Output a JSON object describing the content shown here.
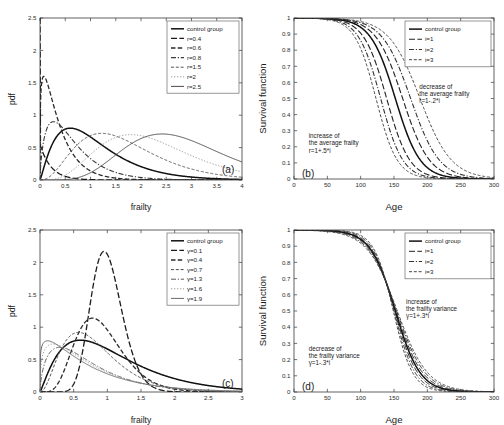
{
  "figure": {
    "title": "",
    "panels": [
      "a",
      "b",
      "c",
      "d"
    ]
  },
  "chart_data": [
    {
      "id": "a",
      "tag": "(a)",
      "type": "line",
      "title": "",
      "xlabel": "frailty",
      "ylabel": "pdf",
      "xlim": [
        0,
        4
      ],
      "ylim": [
        0,
        2.5
      ],
      "xticks": [
        "0",
        "0.5",
        "1",
        "1.5",
        "2",
        "2.5",
        "3",
        "3.5",
        "4"
      ],
      "xtickvals": [
        0,
        0.5,
        1,
        1.5,
        2,
        2.5,
        3,
        3.5,
        4
      ],
      "yticks": [
        "0",
        "0.5",
        "1",
        "1.5",
        "2",
        "2.5"
      ],
      "ytickvals": [
        0,
        0.5,
        1,
        1.5,
        2,
        2.5
      ],
      "grid": false,
      "legend_position": "top-right",
      "legend": [
        "control group",
        "r=0.4",
        "r=0.6",
        "r=0.8",
        "r=1.5",
        "r=2",
        "r=2.5"
      ],
      "series": [
        {
          "name": "control group",
          "shape": "gamma",
          "k": 2.2,
          "scale": 0.5,
          "peak": 0.8,
          "mode": 0.68,
          "style": "solid",
          "color": "#111111",
          "width": 1.5
        },
        {
          "name": "r=0.4",
          "shape": "gamma",
          "k": 1.0,
          "scale": 0.22,
          "peak": 2.5,
          "mode": 0.0,
          "style": "dash-long",
          "color": "#1c1c1c",
          "width": 1.3
        },
        {
          "name": "r=0.6",
          "shape": "gamma",
          "k": 1.25,
          "scale": 0.3,
          "peak": 1.6,
          "mode": 0.1,
          "style": "dash-med",
          "color": "#2a2a2a",
          "width": 1.3
        },
        {
          "name": "r=0.8",
          "shape": "gamma",
          "k": 1.7,
          "scale": 0.38,
          "peak": 0.9,
          "mode": 0.3,
          "style": "dash-dot",
          "color": "#3a3a3a",
          "width": 1.1
        },
        {
          "name": "r=1.5",
          "shape": "gamma",
          "k": 3.6,
          "scale": 0.47,
          "peak": 0.72,
          "mode": 1.25,
          "style": "dash-short",
          "color": "#555555",
          "width": 1.0
        },
        {
          "name": "r=2",
          "shape": "gamma",
          "k": 5.0,
          "scale": 0.45,
          "peak": 0.7,
          "mode": 1.8,
          "style": "dot",
          "color": "#999999",
          "width": 1.0
        },
        {
          "name": "r=2.5",
          "shape": "gamma",
          "k": 7.2,
          "scale": 0.39,
          "peak": 0.71,
          "mode": 2.4,
          "style": "solid",
          "color": "#4a4a4a",
          "width": 1.0
        }
      ]
    },
    {
      "id": "b",
      "tag": "(b)",
      "type": "line",
      "title": "",
      "xlabel": "Age",
      "ylabel": "Survival function",
      "xlim": [
        0,
        300
      ],
      "ylim": [
        0,
        1
      ],
      "xticks": [
        "0",
        "50",
        "100",
        "150",
        "200",
        "250",
        "300"
      ],
      "xtickvals": [
        0,
        50,
        100,
        150,
        200,
        250,
        300
      ],
      "yticks": [
        "0",
        "0.1",
        "0.2",
        "0.3",
        "0.4",
        "0.5",
        "0.6",
        "0.7",
        "0.8",
        "0.9",
        "1"
      ],
      "ytickvals": [
        0,
        0.1,
        0.2,
        0.3,
        0.4,
        0.5,
        0.6,
        0.7,
        0.8,
        0.9,
        1
      ],
      "grid": false,
      "legend_position": "top-right",
      "legend": [
        "control group",
        "i=1",
        "i=2",
        "i=3"
      ],
      "annotations": [
        {
          "name": "decrease-annotation",
          "lines": [
            "decrease of",
            "the average frailty",
            "r=1-.2*i"
          ],
          "x": 188,
          "y": 0.56
        },
        {
          "name": "increase-annotation",
          "lines": [
            "increase of",
            "the average frailty",
            "r=1+.5*i"
          ],
          "x": 22,
          "y": 0.255
        }
      ],
      "series": [
        {
          "name": "control group",
          "median": 152,
          "slope": 27,
          "style": "solid",
          "color": "#111111",
          "width": 1.5
        },
        {
          "name": "i=1 (increase)",
          "legend_ref": "i=1",
          "median": 139,
          "slope": 25,
          "style": "dash-long",
          "color": "#222222",
          "width": 1.1
        },
        {
          "name": "i=2 (increase)",
          "legend_ref": "i=2",
          "median": 130,
          "slope": 24,
          "style": "dash-dot",
          "color": "#333333",
          "width": 1.1
        },
        {
          "name": "i=3 (increase)",
          "legend_ref": "i=3",
          "median": 123,
          "slope": 23,
          "style": "dash-short",
          "color": "#444444",
          "width": 1.0
        },
        {
          "name": "i=1 (decrease)",
          "legend_ref": "i=1",
          "median": 163,
          "slope": 29,
          "style": "dash-long",
          "color": "#222222",
          "width": 1.1
        },
        {
          "name": "i=2 (decrease)",
          "legend_ref": "i=2",
          "median": 175,
          "slope": 31,
          "style": "dash-dot",
          "color": "#333333",
          "width": 1.1
        },
        {
          "name": "i=3 (decrease)",
          "legend_ref": "i=3",
          "median": 189,
          "slope": 34,
          "style": "dash-short",
          "color": "#444444",
          "width": 1.0
        }
      ]
    },
    {
      "id": "c",
      "tag": "(c)",
      "type": "line",
      "title": "",
      "xlabel": "frailty",
      "ylabel": "pdf",
      "xlim": [
        0,
        3
      ],
      "ylim": [
        0,
        2.5
      ],
      "xticks": [
        "0",
        "0.5",
        "1",
        "1.5",
        "2",
        "2.5",
        "3"
      ],
      "xtickvals": [
        0,
        0.5,
        1,
        1.5,
        2,
        2.5,
        3
      ],
      "yticks": [
        "0",
        "0.5",
        "1",
        "1.5",
        "2",
        "2.5"
      ],
      "ytickvals": [
        0,
        0.5,
        1,
        1.5,
        2,
        2.5
      ],
      "grid": false,
      "legend_position": "top-right",
      "legend": [
        "control group",
        "γ=0.1",
        "γ=0.4",
        "γ=0.7",
        "γ=1.3",
        "γ=1.6",
        "γ=1.9"
      ],
      "series": [
        {
          "name": "control group",
          "shape": "gamma",
          "k": 2.2,
          "scale": 0.5,
          "peak": 0.8,
          "mode": 0.68,
          "style": "solid",
          "color": "#111111",
          "width": 1.5
        },
        {
          "name": "γ=0.1",
          "shape": "gamma",
          "k": 18.0,
          "scale": 0.056,
          "peak": 2.17,
          "mode": 0.95,
          "style": "dash-long",
          "color": "#1c1c1c",
          "width": 1.3
        },
        {
          "name": "γ=0.4",
          "shape": "gamma",
          "k": 6.2,
          "scale": 0.15,
          "peak": 1.14,
          "mode": 0.88,
          "style": "dash-med",
          "color": "#2a2a2a",
          "width": 1.3
        },
        {
          "name": "γ=0.7",
          "shape": "gamma",
          "k": 3.2,
          "scale": 0.26,
          "peak": 0.92,
          "mode": 0.72,
          "style": "dash-short",
          "color": "#4a4a4a",
          "width": 1.0
        },
        {
          "name": "γ=1.3",
          "shape": "gamma",
          "k": 1.65,
          "scale": 0.45,
          "peak": 0.69,
          "mode": 0.42,
          "style": "dash-dot",
          "color": "#5a5a5a",
          "width": 1.0
        },
        {
          "name": "γ=1.6",
          "shape": "gamma",
          "k": 1.35,
          "scale": 0.55,
          "peak": 0.74,
          "mode": 0.25,
          "style": "dot",
          "color": "#9a9a9a",
          "width": 1.0
        },
        {
          "name": "γ=1.9",
          "shape": "gamma",
          "k": 1.18,
          "scale": 0.62,
          "peak": 0.79,
          "mode": 0.15,
          "style": "solid",
          "color": "#6a6a6a",
          "width": 1.0
        }
      ]
    },
    {
      "id": "d",
      "tag": "(d)",
      "type": "line",
      "title": "",
      "xlabel": "Age",
      "ylabel": "Survival function",
      "xlim": [
        0,
        300
      ],
      "ylim": [
        0,
        1
      ],
      "xticks": [
        "0",
        "50",
        "100",
        "150",
        "200",
        "250",
        "300"
      ],
      "xtickvals": [
        0,
        50,
        100,
        150,
        200,
        250,
        300
      ],
      "yticks": [
        "0",
        "0.1",
        "0.2",
        "0.3",
        "0.4",
        "0.5",
        "0.6",
        "0.7",
        "0.8",
        "0.9",
        "1"
      ],
      "ytickvals": [
        0,
        0.1,
        0.2,
        0.3,
        0.4,
        0.5,
        0.6,
        0.7,
        0.8,
        0.9,
        1
      ],
      "grid": false,
      "legend_position": "top-right",
      "legend": [
        "control group",
        "i=1",
        "i=2",
        "i=3"
      ],
      "annotations": [
        {
          "name": "increase-annotation",
          "lines": [
            "increase of",
            "the frailty variance",
            "γ=1+.3*i"
          ],
          "x": 168,
          "y": 0.545
        },
        {
          "name": "decrease-annotation",
          "lines": [
            "decrease of",
            "the frailty variance",
            "γ=1-.3*i"
          ],
          "x": 22,
          "y": 0.255
        }
      ],
      "series": [
        {
          "name": "control group",
          "median": 152,
          "slope": 27,
          "style": "solid",
          "color": "#111111",
          "width": 1.5
        },
        {
          "name": "i=1 (increase)",
          "legend_ref": "i=1",
          "median": 153,
          "slope": 29,
          "style": "dash-long",
          "color": "#222222",
          "width": 1.0
        },
        {
          "name": "i=2 (increase)",
          "legend_ref": "i=2",
          "median": 154,
          "slope": 31,
          "style": "dash-dot",
          "color": "#333333",
          "width": 1.0
        },
        {
          "name": "i=3 (increase)",
          "legend_ref": "i=3",
          "median": 155,
          "slope": 33,
          "style": "dash-short",
          "color": "#444444",
          "width": 1.0
        },
        {
          "name": "i=1 (decrease)",
          "legend_ref": "i=1",
          "median": 151,
          "slope": 25,
          "style": "dash-long",
          "color": "#222222",
          "width": 1.0
        },
        {
          "name": "i=2 (decrease)",
          "legend_ref": "i=2",
          "median": 150,
          "slope": 23,
          "style": "dash-dot",
          "color": "#333333",
          "width": 1.0
        },
        {
          "name": "i=3 (decrease)",
          "legend_ref": "i=3",
          "median": 149,
          "slope": 21,
          "style": "dash-short",
          "color": "#444444",
          "width": 1.0
        }
      ]
    }
  ]
}
